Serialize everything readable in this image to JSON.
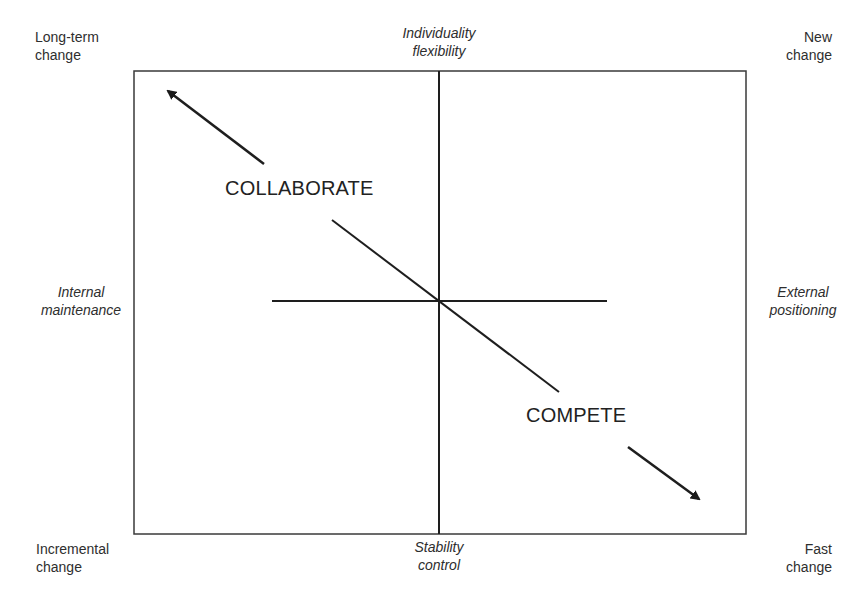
{
  "corners": {
    "top_left": [
      "Long-term",
      "change"
    ],
    "top_right": [
      "New",
      "change"
    ],
    "bottom_left": [
      "Incremental",
      "change"
    ],
    "bottom_right": [
      "Fast",
      "change"
    ]
  },
  "axes": {
    "top": [
      "Individuality",
      "flexibility"
    ],
    "bottom": [
      "Stability",
      "control"
    ],
    "left": [
      "Internal",
      "maintenance"
    ],
    "right": [
      "External",
      "positioning"
    ]
  },
  "strategies": {
    "upper": "COLLABORATE",
    "lower": "COMPETE"
  },
  "colors": {
    "line": "#222222",
    "frame": "#3a3a3a",
    "text": "#2e2e2e"
  }
}
